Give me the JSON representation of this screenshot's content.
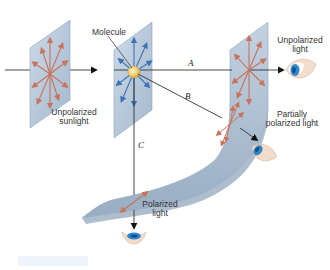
{
  "diagram": {
    "labels": {
      "molecule": "Molecule",
      "unpolarized_sunlight_line1": "Unpolarized",
      "unpolarized_sunlight_line2": "sunlight",
      "unpolarized_light_line1": "Unpolarized",
      "unpolarized_light_line2": "light",
      "partially_polarized_line1": "Partially",
      "partially_polarized_line2": "polarized light",
      "polarized_line1": "Polarized",
      "polarized_line2": "light"
    },
    "paths": {
      "a": "A",
      "b": "B",
      "c": "C"
    },
    "colors": {
      "sheet_fill": "#b9cbdc",
      "sheet_edge": "#8fa6bc",
      "red_arrows": "#c8735a",
      "blue_arrows": "#3f74b4",
      "molecule": "#f3d27a",
      "ray": "#333333",
      "eye_iris": "#2f86d0"
    },
    "icons": {
      "eye_forward": "eye-icon",
      "eye_partial": "eye-icon",
      "eye_down": "eye-icon"
    }
  }
}
